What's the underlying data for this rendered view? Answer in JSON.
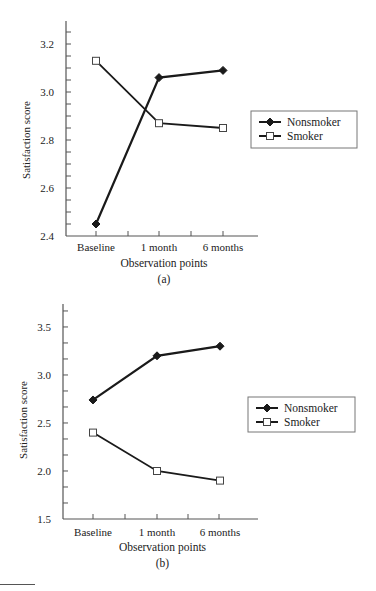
{
  "chart_data": [
    {
      "type": "line",
      "panel_label": "(a)",
      "title": "",
      "xlabel": "Observation points",
      "ylabel": "Satisfaction score",
      "categories": [
        "Baseline",
        "1 month",
        "6 months"
      ],
      "ylim": [
        2.4,
        3.3
      ],
      "yticks": [
        2.4,
        2.6,
        2.8,
        3.0,
        3.2
      ],
      "ytick_labels": [
        "2.4",
        "2.6",
        "2.8",
        "3.0",
        "3.2"
      ],
      "minor_ytick_step": 0.05,
      "grid": false,
      "legend_position": "right",
      "series": [
        {
          "name": "Nonsmoker",
          "marker": "filled-diamond",
          "values": [
            2.45,
            3.06,
            3.09
          ]
        },
        {
          "name": "Smoker",
          "marker": "open-square",
          "values": [
            3.13,
            2.87,
            2.85
          ]
        }
      ]
    },
    {
      "type": "line",
      "panel_label": "(b)",
      "title": "",
      "xlabel": "Observation points",
      "ylabel": "Satisfaction score",
      "categories": [
        "Baseline",
        "1 month",
        "6 months"
      ],
      "ylim": [
        1.5,
        3.7
      ],
      "yticks": [
        1.5,
        2.0,
        2.5,
        3.0,
        3.5
      ],
      "ytick_labels": [
        "1.5",
        "2.0",
        "2.5",
        "3.0",
        "3.5"
      ],
      "minor_ytick_step": 0.1667,
      "grid": false,
      "legend_position": "right",
      "series": [
        {
          "name": "Nonsmoker",
          "marker": "filled-diamond",
          "values": [
            2.74,
            3.2,
            3.3
          ]
        },
        {
          "name": "Smoker",
          "marker": "open-square",
          "values": [
            2.4,
            2.0,
            1.9
          ]
        }
      ]
    }
  ],
  "colors": {
    "line": "#1a1a1a",
    "axis": "#555555",
    "legend_border": "#777777",
    "background": "#ffffff"
  }
}
